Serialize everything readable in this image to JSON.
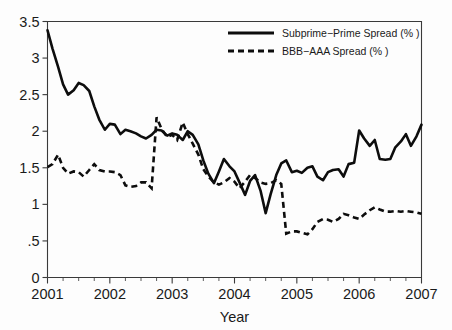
{
  "chart_data": {
    "type": "line",
    "title": "",
    "xlabel": "Year",
    "ylabel": "",
    "xlim": [
      2001.0,
      2007.0
    ],
    "ylim": [
      0,
      3.5
    ],
    "grid": false,
    "legend_position": "top-right",
    "x_tick_labels": [
      "2001",
      "2002",
      "2003",
      "2004",
      "2005",
      "2006",
      "2007"
    ],
    "x_tick_values": [
      2001,
      2002,
      2003,
      2004,
      2005,
      2006,
      2007
    ],
    "x_minor_tick_interval": 0.25,
    "y_tick_labels": [
      "0",
      ".5",
      "1",
      "1.5",
      "2",
      "2.5",
      "3",
      "3.5"
    ],
    "y_tick_values": [
      0,
      0.5,
      1,
      1.5,
      2,
      2.5,
      3,
      3.5
    ],
    "series": [
      {
        "name": "Subprime−Prime Spread (%  )",
        "style": "solid",
        "color": "#0d0d0d",
        "x": [
          2001.0,
          2001.08,
          2001.17,
          2001.25,
          2001.33,
          2001.42,
          2001.5,
          2001.58,
          2001.67,
          2001.75,
          2001.83,
          2001.92,
          2002.0,
          2002.08,
          2002.17,
          2002.25,
          2002.33,
          2002.42,
          2002.5,
          2002.58,
          2002.67,
          2002.75,
          2002.83,
          2002.92,
          2003.0,
          2003.08,
          2003.17,
          2003.25,
          2003.33,
          2003.42,
          2003.5,
          2003.58,
          2003.67,
          2003.75,
          2003.83,
          2003.92,
          2004.0,
          2004.08,
          2004.17,
          2004.25,
          2004.33,
          2004.42,
          2004.5,
          2004.58,
          2004.67,
          2004.75,
          2004.83,
          2004.92,
          2005.0,
          2005.08,
          2005.17,
          2005.25,
          2005.33,
          2005.42,
          2005.5,
          2005.58,
          2005.67,
          2005.75,
          2005.83,
          2005.92,
          2006.0,
          2006.08,
          2006.17,
          2006.25,
          2006.33,
          2006.42,
          2006.5,
          2006.58,
          2006.67,
          2006.75,
          2006.83,
          2006.92,
          2007.0
        ],
        "y": [
          3.38,
          3.13,
          2.88,
          2.64,
          2.5,
          2.56,
          2.66,
          2.63,
          2.55,
          2.34,
          2.16,
          2.02,
          2.1,
          2.09,
          1.96,
          2.02,
          2.0,
          1.97,
          1.93,
          1.9,
          1.95,
          2.02,
          2.01,
          1.94,
          1.97,
          1.95,
          1.88,
          2.0,
          1.95,
          1.82,
          1.6,
          1.42,
          1.29,
          1.45,
          1.62,
          1.52,
          1.45,
          1.3,
          1.13,
          1.32,
          1.4,
          1.18,
          0.88,
          1.14,
          1.4,
          1.56,
          1.6,
          1.44,
          1.46,
          1.43,
          1.5,
          1.52,
          1.38,
          1.33,
          1.44,
          1.47,
          1.48,
          1.38,
          1.55,
          1.57,
          2.01,
          1.9,
          1.8,
          1.88,
          1.62,
          1.61,
          1.62,
          1.78,
          1.86,
          1.96,
          1.8,
          1.93,
          2.09
        ]
      },
      {
        "name": "BBB−AAA Spread (%  )",
        "style": "dashed",
        "color": "#0d0d0d",
        "x": [
          2001.0,
          2001.08,
          2001.17,
          2001.25,
          2001.33,
          2001.42,
          2001.5,
          2001.58,
          2001.67,
          2001.75,
          2001.83,
          2001.92,
          2002.0,
          2002.08,
          2002.17,
          2002.25,
          2002.33,
          2002.42,
          2002.5,
          2002.58,
          2002.67,
          2002.75,
          2002.83,
          2002.92,
          2003.0,
          2003.08,
          2003.17,
          2003.25,
          2003.33,
          2003.42,
          2003.5,
          2003.58,
          2003.67,
          2003.75,
          2003.83,
          2003.92,
          2004.0,
          2004.08,
          2004.17,
          2004.25,
          2004.33,
          2004.42,
          2004.5,
          2004.58,
          2004.67,
          2004.75,
          2004.83,
          2004.92,
          2005.0,
          2005.08,
          2005.17,
          2005.25,
          2005.33,
          2005.42,
          2005.5,
          2005.58,
          2005.67,
          2005.75,
          2005.83,
          2005.92,
          2006.0,
          2006.08,
          2006.17,
          2006.25,
          2006.33,
          2006.42,
          2006.5,
          2006.58,
          2006.67,
          2006.75,
          2006.83,
          2006.92,
          2007.0
        ],
        "y": [
          1.51,
          1.55,
          1.68,
          1.5,
          1.42,
          1.45,
          1.44,
          1.38,
          1.47,
          1.55,
          1.47,
          1.45,
          1.45,
          1.44,
          1.4,
          1.26,
          1.24,
          1.25,
          1.3,
          1.3,
          1.22,
          2.19,
          2.03,
          1.92,
          1.95,
          1.88,
          2.12,
          1.96,
          1.83,
          1.68,
          1.48,
          1.38,
          1.3,
          1.27,
          1.3,
          1.36,
          1.31,
          1.22,
          1.31,
          1.4,
          1.36,
          1.3,
          1.28,
          1.29,
          1.33,
          1.28,
          0.6,
          0.63,
          0.63,
          0.61,
          0.59,
          0.66,
          0.76,
          0.8,
          0.79,
          0.76,
          0.8,
          0.87,
          0.85,
          0.82,
          0.8,
          0.86,
          0.92,
          0.96,
          0.93,
          0.9,
          0.9,
          0.91,
          0.9,
          0.91,
          0.9,
          0.89,
          0.87
        ]
      }
    ]
  },
  "axes": {
    "x_title": "Year"
  },
  "legend": {
    "entries": [
      {
        "label": "Subprime−Prime Spread (%  )",
        "style": "solid"
      },
      {
        "label": "BBB−AAA Spread (%  )",
        "style": "dashed"
      }
    ]
  }
}
